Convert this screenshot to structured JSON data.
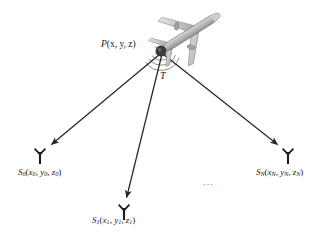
{
  "diagram": {
    "background_color": "#ffffff",
    "line_color": "#262626",
    "aircraft_color": "#9a9a9a",
    "hub": {
      "name": "point-p",
      "label_prefix": "P",
      "coords": "(x, y, z)",
      "x": 161,
      "y": 51,
      "radius": 5.0
    },
    "angle_marker": {
      "label": "T",
      "arc_count": 4,
      "color": "#4a4a4a"
    },
    "ellipsis": "...",
    "nodes": [
      {
        "id": "s0",
        "symbol": "S",
        "subscript": "0",
        "args": [
          "x",
          "y",
          "z"
        ],
        "arg_subscripts": [
          "0",
          "0",
          "0"
        ],
        "label_text": "S0(x0, y0, z0)",
        "antenna_x": 40,
        "antenna_y": 150,
        "arrow_tip_x": 49,
        "arrow_tip_y": 146
      },
      {
        "id": "s1",
        "symbol": "S",
        "subscript": "1",
        "args": [
          "x",
          "y",
          "z"
        ],
        "arg_subscripts": [
          "1",
          "1",
          "1"
        ],
        "label_text": "S1(x1, y1, z1)",
        "antenna_x": 124,
        "antenna_y": 206,
        "arrow_tip_x": 126,
        "arrow_tip_y": 199
      },
      {
        "id": "sn",
        "symbol": "S",
        "subscript": "N",
        "args": [
          "x",
          "y",
          "z"
        ],
        "arg_subscripts": [
          "N",
          "N",
          "N"
        ],
        "label_text": "SN(xN, yN, zN)",
        "antenna_x": 288,
        "antenna_y": 150,
        "arrow_tip_x": 280,
        "arrow_tip_y": 146
      }
    ],
    "aircraft": {
      "name": "airplane-silhouette",
      "heading_degrees": -32,
      "center_x": 193,
      "center_y": 31
    }
  }
}
